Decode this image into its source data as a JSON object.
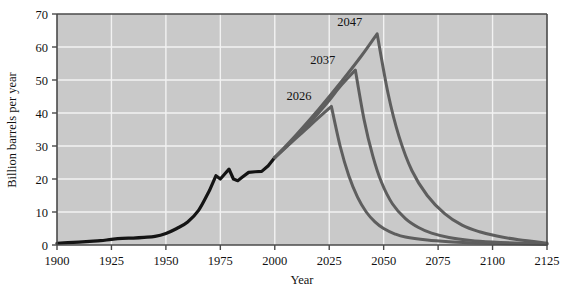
{
  "chart_data": {
    "type": "line",
    "title": "",
    "xlabel": "Year",
    "ylabel": "Billion barrels per year",
    "xlim": [
      1900,
      2125
    ],
    "ylim": [
      0,
      70
    ],
    "xticks": [
      1900,
      1925,
      1950,
      1975,
      2000,
      2025,
      2050,
      2075,
      2100,
      2125
    ],
    "yticks": [
      0,
      10,
      20,
      30,
      40,
      50,
      60,
      70
    ],
    "grid": true,
    "legend": "none",
    "background": "#c9c9c9",
    "gridline_color": "#f2f2f2",
    "annotations": [
      {
        "text": "2026",
        "x": 2026,
        "y": 42
      },
      {
        "text": "2037",
        "x": 2037,
        "y": 53
      },
      {
        "text": "2047",
        "x": 2047,
        "y": 64
      }
    ],
    "series": [
      {
        "name": "Historical production",
        "color": "#141414",
        "x": [
          1900,
          1905,
          1910,
          1915,
          1920,
          1925,
          1930,
          1935,
          1940,
          1945,
          1950,
          1955,
          1960,
          1965,
          1970,
          1973,
          1975,
          1977,
          1979,
          1981,
          1983,
          1985,
          1988,
          1991,
          1994,
          1997,
          2000
        ],
        "y": [
          0.5,
          0.7,
          0.9,
          1.1,
          1.3,
          1.7,
          2.0,
          2.1,
          2.3,
          2.6,
          3.5,
          5.0,
          7.0,
          10.5,
          16.5,
          21.0,
          20.0,
          21.5,
          23.0,
          20.0,
          19.5,
          20.5,
          22.0,
          22.2,
          22.3,
          24.0,
          26.5
        ]
      },
      {
        "name": "Projection peak 2026",
        "color": "#5e5e5e",
        "peak_year": 2026,
        "peak_value": 42,
        "x": [
          2000,
          2005,
          2010,
          2015,
          2020,
          2026,
          2030,
          2034,
          2038,
          2042,
          2046,
          2050,
          2055,
          2060,
          2070,
          2080,
          2090,
          2100,
          2110,
          2125
        ],
        "y": [
          26.5,
          29.5,
          32.5,
          35.5,
          38.5,
          42.0,
          30.0,
          21.0,
          14.5,
          10.0,
          7.0,
          5.0,
          3.4,
          2.4,
          1.5,
          1.0,
          0.7,
          0.5,
          0.35,
          0.2
        ]
      },
      {
        "name": "Projection peak 2037",
        "color": "#5e5e5e",
        "peak_year": 2037,
        "peak_value": 53,
        "x": [
          2000,
          2008,
          2016,
          2024,
          2030,
          2037,
          2041,
          2045,
          2049,
          2054,
          2060,
          2066,
          2072,
          2080,
          2090,
          2100,
          2110,
          2125
        ],
        "y": [
          26.5,
          31.5,
          37.0,
          43.0,
          48.0,
          53.0,
          38.0,
          27.0,
          19.0,
          12.5,
          8.0,
          5.3,
          3.6,
          2.3,
          1.4,
          0.9,
          0.6,
          0.3
        ]
      },
      {
        "name": "Projection peak 2047",
        "color": "#5e5e5e",
        "peak_year": 2047,
        "peak_value": 64,
        "x": [
          2000,
          2010,
          2020,
          2030,
          2040,
          2047,
          2052,
          2057,
          2063,
          2070,
          2078,
          2086,
          2094,
          2102,
          2112,
          2125
        ],
        "y": [
          26.5,
          33.5,
          41.0,
          49.0,
          57.5,
          64.0,
          46.0,
          33.0,
          22.5,
          15.0,
          9.5,
          6.0,
          4.0,
          2.7,
          1.6,
          0.6
        ]
      }
    ]
  }
}
